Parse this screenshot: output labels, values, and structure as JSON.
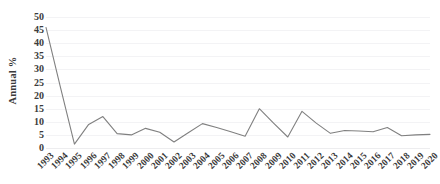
{
  "chart_data": {
    "type": "line",
    "title": "",
    "subtitle": "",
    "xlabel": "",
    "ylabel": "Annual %",
    "x": [
      "1993",
      "1994",
      "1995",
      "1996",
      "1997",
      "1998",
      "1999",
      "2000",
      "2001",
      "2002",
      "2003",
      "2004",
      "2005",
      "2006",
      "2007",
      "2008",
      "2009",
      "2010",
      "2011",
      "2012",
      "2013",
      "2014",
      "2015",
      "2016",
      "2017",
      "2018",
      "2019",
      "2020"
    ],
    "categories": [
      "1993",
      "1994",
      "1995",
      "1996",
      "1997",
      "1998",
      "1999",
      "2000",
      "2001",
      "2002",
      "2003",
      "2004",
      "2005",
      "2006",
      "2007",
      "2008",
      "2009",
      "2010",
      "2011",
      "2012",
      "2013",
      "2014",
      "2015",
      "2016",
      "2017",
      "2018",
      "2019",
      "2020"
    ],
    "series": [
      {
        "name": "Annual %",
        "values": [
          46.0,
          23.5,
          1.5,
          9.0,
          12.0,
          5.5,
          5.0,
          7.5,
          6.0,
          2.3,
          5.8,
          9.3,
          7.8,
          6.2,
          4.5,
          15.0,
          9.5,
          4.2,
          14.0,
          9.5,
          5.6,
          6.7,
          6.5,
          6.2,
          7.8,
          4.7,
          5.0,
          5.2
        ]
      }
    ],
    "values": [
      46.0,
      23.5,
      1.5,
      9.0,
      12.0,
      5.5,
      5.0,
      7.5,
      6.0,
      2.3,
      5.8,
      9.3,
      7.8,
      6.2,
      4.5,
      15.0,
      9.5,
      4.2,
      14.0,
      9.5,
      5.6,
      6.7,
      6.5,
      6.2,
      7.8,
      4.7,
      5.0,
      5.2
    ],
    "ylim": [
      0,
      50
    ],
    "yticks": [
      0,
      5,
      10,
      15,
      20,
      25,
      30,
      35,
      40,
      45,
      50
    ],
    "ytick_labels": [
      "0",
      "5",
      "10",
      "15",
      "20",
      "25",
      "30",
      "35",
      "40",
      "45",
      "50"
    ],
    "grid": true,
    "grid_axis": "y",
    "legend": false,
    "legend_position": "none",
    "line_color": "#808080",
    "grid_color": "#f3f3f5",
    "text_color": "#3b3b3b",
    "background": "#ffffff",
    "markers": false,
    "annotations": []
  }
}
